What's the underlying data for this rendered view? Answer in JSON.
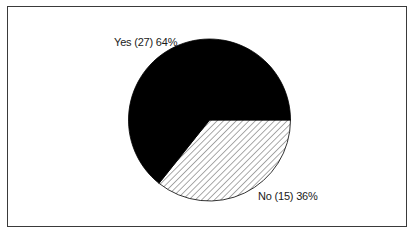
{
  "chart_data": {
    "type": "pie",
    "title": "",
    "categories": [
      "Yes",
      "No"
    ],
    "values": [
      27,
      15
    ],
    "percentages": [
      64,
      36
    ],
    "labels": [
      "Yes (27) 64%",
      "No (15) 36%"
    ],
    "fills": [
      "solid-black",
      "diagonal-hatch"
    ],
    "colors": [
      "#000000",
      "#ffffff"
    ],
    "start_angle_deg": 0,
    "direction": "clockwise",
    "legend": "none"
  },
  "labels": {
    "yes": "Yes (27) 64%",
    "no": "No (15) 36%"
  }
}
